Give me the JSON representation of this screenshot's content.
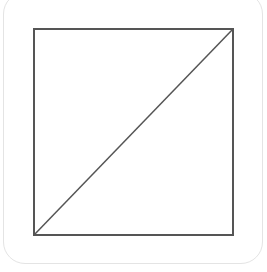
{
  "diagram": {
    "canvas": {
      "width": 267,
      "height": 272
    },
    "card": {
      "border_color": "#e4e4e4",
      "corner_radius": 22
    },
    "square": {
      "x": 34,
      "y": 29,
      "width": 199,
      "height": 206,
      "stroke": "#555555",
      "stroke_width": 2
    },
    "diagonal": {
      "from": {
        "x": 34,
        "y": 235
      },
      "to": {
        "x": 233,
        "y": 29
      },
      "stroke": "#555555",
      "stroke_width": 1.5
    }
  }
}
